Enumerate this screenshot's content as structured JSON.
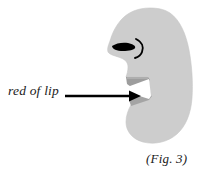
{
  "figure": {
    "caption": "(Fig. 3)",
    "annotation_label": "red of lip",
    "background_color": "#ffffff",
    "colors": {
      "head_fill": "#cdcdcd",
      "head_fill_edge": "#c2c2c2",
      "lip_shadow": "#9a9a9a",
      "lip_shadow_light": "#b0b0b0",
      "nostril": "#000000",
      "nose_crease": "#000000",
      "arrow": "#000000",
      "text": "#1a1a1a"
    },
    "parts": [
      {
        "name": "head-silhouette",
        "description": "gray profile of head, nose, lips and chin"
      },
      {
        "name": "nostril",
        "description": "black almond shaped nostril"
      },
      {
        "name": "nose-crease",
        "description": "black curved arc beside nostril"
      },
      {
        "name": "upper-lip",
        "description": "darker gray wedge forming upper lip vermilion"
      },
      {
        "name": "lower-lip",
        "description": "darker gray wedge forming lower lip vermilion"
      }
    ],
    "annotation": {
      "label": "red of lip",
      "arrow": {
        "name": "pointer-arrow",
        "from_x": 65,
        "from_y": 96,
        "to_x": 141,
        "to_y": 96,
        "color": "#000000"
      }
    }
  }
}
